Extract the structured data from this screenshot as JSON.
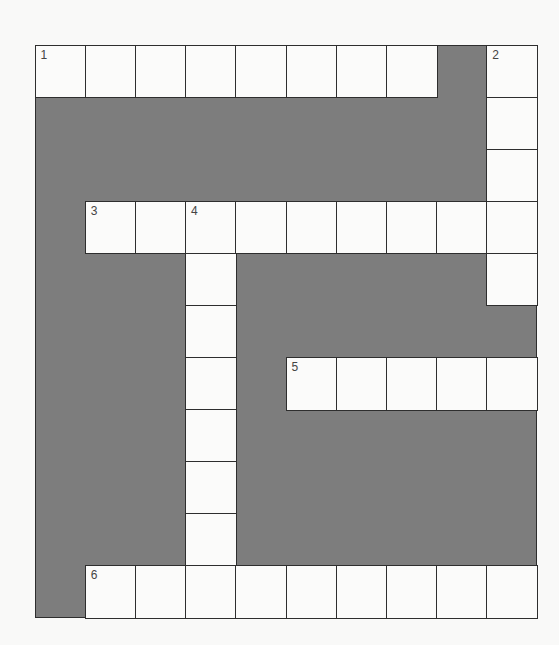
{
  "puzzle": {
    "rows": 11,
    "cols": 10,
    "colors": {
      "block": "#7d7d7d",
      "cell": "#fbfbfa",
      "border": "#2e2e2e",
      "number": "#444444"
    },
    "white_cells": [
      [
        0,
        0
      ],
      [
        0,
        1
      ],
      [
        0,
        2
      ],
      [
        0,
        3
      ],
      [
        0,
        4
      ],
      [
        0,
        5
      ],
      [
        0,
        6
      ],
      [
        0,
        7
      ],
      [
        0,
        9
      ],
      [
        1,
        9
      ],
      [
        2,
        9
      ],
      [
        3,
        1
      ],
      [
        3,
        2
      ],
      [
        3,
        3
      ],
      [
        3,
        4
      ],
      [
        3,
        5
      ],
      [
        3,
        6
      ],
      [
        3,
        7
      ],
      [
        3,
        8
      ],
      [
        3,
        9
      ],
      [
        4,
        3
      ],
      [
        4,
        9
      ],
      [
        5,
        3
      ],
      [
        6,
        3
      ],
      [
        6,
        5
      ],
      [
        6,
        6
      ],
      [
        6,
        7
      ],
      [
        6,
        8
      ],
      [
        6,
        9
      ],
      [
        7,
        3
      ],
      [
        8,
        3
      ],
      [
        9,
        3
      ],
      [
        10,
        1
      ],
      [
        10,
        2
      ],
      [
        10,
        3
      ],
      [
        10,
        4
      ],
      [
        10,
        5
      ],
      [
        10,
        6
      ],
      [
        10,
        7
      ],
      [
        10,
        8
      ],
      [
        10,
        9
      ]
    ],
    "numbers": [
      {
        "row": 0,
        "col": 0,
        "label": "1"
      },
      {
        "row": 0,
        "col": 9,
        "label": "2"
      },
      {
        "row": 3,
        "col": 1,
        "label": "3"
      },
      {
        "row": 3,
        "col": 3,
        "label": "4"
      },
      {
        "row": 6,
        "col": 5,
        "label": "5"
      },
      {
        "row": 10,
        "col": 1,
        "label": "6"
      }
    ],
    "entries": [
      {
        "number": "1",
        "direction": "across",
        "length": 8
      },
      {
        "number": "2",
        "direction": "down",
        "length": 5
      },
      {
        "number": "3",
        "direction": "across",
        "length": 9
      },
      {
        "number": "4",
        "direction": "down",
        "length": 8
      },
      {
        "number": "5",
        "direction": "across",
        "length": 5
      },
      {
        "number": "6",
        "direction": "across",
        "length": 9
      }
    ]
  }
}
